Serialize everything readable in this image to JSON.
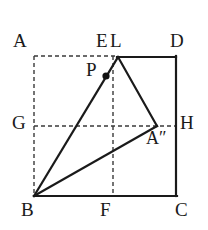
{
  "figure": {
    "stroke_color": "#1a1a1a",
    "dash_color": "#3a3a3a",
    "background": "#ffffff",
    "solid_width": 2.2,
    "dash_width": 1.4,
    "dash_pattern": "4,3"
  },
  "labels": {
    "A": "A",
    "E": "E",
    "L": "L",
    "D": "D",
    "P": "P",
    "G": "G",
    "H": "H",
    "A_double_prime": "A″",
    "B": "B",
    "F": "F",
    "C": "C"
  },
  "geometry": {
    "points": {
      "A": [
        34,
        56
      ],
      "D": [
        176,
        56
      ],
      "C": [
        176,
        196
      ],
      "B": [
        34,
        196
      ],
      "E": [
        113,
        56
      ],
      "F": [
        113,
        196
      ],
      "G": [
        34,
        126
      ],
      "H": [
        176,
        126
      ],
      "L": [
        118,
        57
      ],
      "P": [
        106,
        76
      ],
      "A_double_prime": [
        156,
        126
      ]
    },
    "solid_segments": [
      [
        "L",
        "D"
      ],
      [
        "D",
        "C"
      ],
      [
        "C",
        "B"
      ],
      [
        "B",
        "L"
      ],
      [
        "L",
        "A_double_prime"
      ],
      [
        "B",
        "A_double_prime"
      ]
    ],
    "dashed_segments": [
      [
        "A",
        "E"
      ],
      [
        "A",
        "B"
      ],
      [
        "G",
        "H"
      ],
      [
        "E",
        "F"
      ]
    ],
    "marked_points": [
      "P"
    ]
  }
}
